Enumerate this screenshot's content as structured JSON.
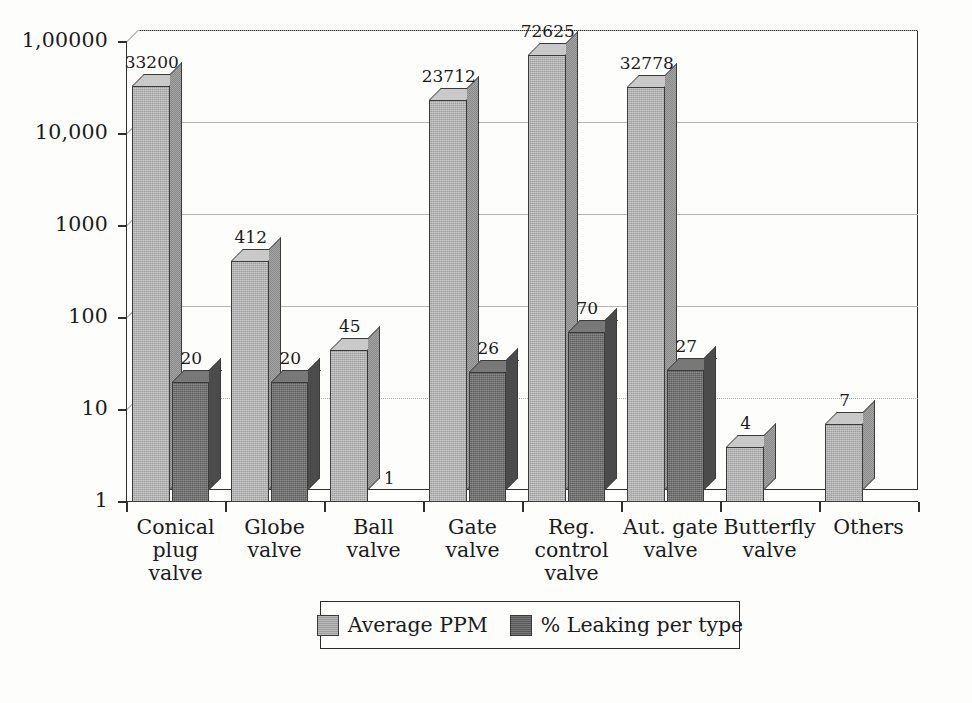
{
  "chart_data": {
    "type": "bar",
    "title": "",
    "xlabel": "",
    "ylabel": "",
    "scale": "log",
    "grid": true,
    "legend_position": "bottom",
    "ylim": [
      1,
      100000
    ],
    "ytick_labels": [
      "1,00000",
      "10,000",
      "1000",
      "100",
      "10",
      "1"
    ],
    "ytick_values": [
      100000,
      10000,
      1000,
      100,
      10,
      1
    ],
    "categories": [
      "Conical plug valve",
      "Globe valve",
      "Ball valve",
      "Gate valve",
      "Reg. control valve",
      "Aut. gate valve",
      "Butterfly valve",
      "Others"
    ],
    "category_lines": [
      [
        "Conical",
        "plug",
        "valve"
      ],
      [
        "Globe",
        "valve"
      ],
      [
        "Ball",
        "valve"
      ],
      [
        "Gate",
        "valve"
      ],
      [
        "Reg.",
        "control",
        "valve"
      ],
      [
        "Aut. gate",
        "valve"
      ],
      [
        "Butterfly",
        "valve"
      ],
      [
        "Others"
      ]
    ],
    "series": [
      {
        "name": "Average PPM",
        "color": "#9d9d9d",
        "values": [
          33200,
          412,
          45,
          23712,
          72625,
          32778,
          4,
          7
        ],
        "labels": [
          "33200",
          "412",
          "45",
          "23712",
          "72625",
          "32778",
          "4",
          "7"
        ]
      },
      {
        "name": "% Leaking per type",
        "color": "#5a5a5a",
        "values": [
          20,
          20,
          1,
          26,
          70,
          27,
          null,
          null
        ],
        "labels": [
          "20",
          "20",
          "1",
          "26",
          "70",
          "27",
          "",
          ""
        ]
      }
    ]
  },
  "legend": {
    "items": [
      {
        "label": "Average PPM",
        "swatch": "light-gray-swatch"
      },
      {
        "label": "% Leaking per type",
        "swatch": "dark-gray-swatch"
      }
    ]
  }
}
